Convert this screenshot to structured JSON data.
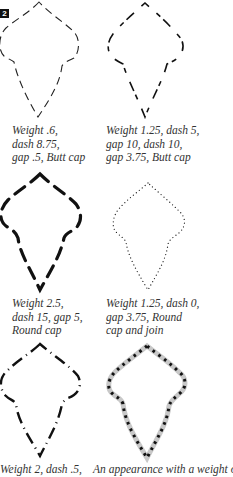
{
  "figure": {
    "badge": "2",
    "items": [
      {
        "line1": "Weight .6,",
        "line2": "dash 8.75,",
        "line3": "gap .5, Butt cap"
      },
      {
        "line1": "Weight 1.25, dash 5,",
        "line2": "gap 10, dash 10,",
        "line3": "gap 3.75, Butt cap"
      },
      {
        "line1": "Weight 2.5,",
        "line2": "dash 15, gap 5,",
        "line3": "Round cap"
      },
      {
        "line1": "Weight 1.25, dash 0,",
        "line2": "gap 3.75, Round",
        "line3": "cap and join"
      },
      {
        "line1": "Weight 2, dash .5,",
        "line2": "",
        "line3": ""
      },
      {
        "line1": "An appearance with a weight of 3,",
        "line2": "",
        "line3": ""
      }
    ]
  }
}
